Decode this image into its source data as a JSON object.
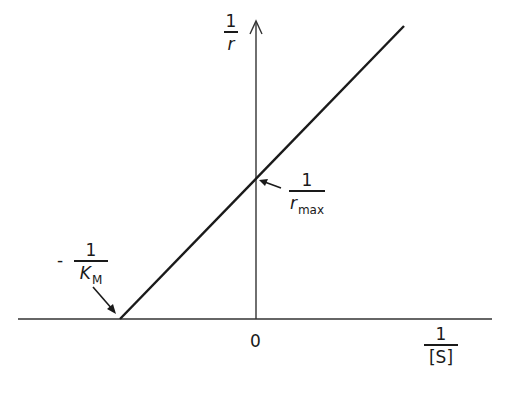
{
  "diagram": {
    "y_axis_label": {
      "numerator": "1",
      "denominator": "r"
    },
    "x_axis_label": {
      "numerator": "1",
      "denominator": "[S]"
    },
    "origin_label": "0",
    "y_intercept_label": {
      "numerator": "1",
      "denominator": "r",
      "subscript": "max"
    },
    "x_intercept_label": {
      "sign": "-",
      "numerator": "1",
      "denominator": "K",
      "subscript": "M"
    },
    "line_color": "#1a1a1a",
    "axis_color": "#333333"
  }
}
